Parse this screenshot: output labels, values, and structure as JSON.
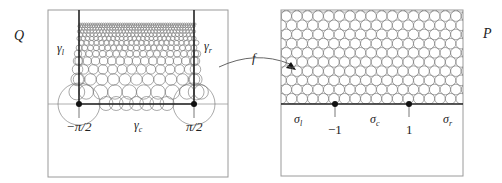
{
  "figure": {
    "left_panel": {
      "domain_label": "Q",
      "curve_labels": {
        "left": "γ",
        "left_sub": "l",
        "right": "γ",
        "right_sub": "r",
        "center": "γ",
        "center_sub": "c"
      },
      "tick_labels": {
        "left": "−π/2",
        "right": "π/2"
      }
    },
    "map_label": "f",
    "right_panel": {
      "domain_label": "P",
      "segment_labels": {
        "left": "σ",
        "left_sub": "l",
        "center": "σ",
        "center_sub": "c",
        "right": "σ",
        "right_sub": "r"
      },
      "tick_labels": {
        "left": "−1",
        "right": "1"
      }
    }
  },
  "colors": {
    "frame": "#9a9a9a",
    "circle": "#6e6e6e",
    "axis": "#222222"
  }
}
